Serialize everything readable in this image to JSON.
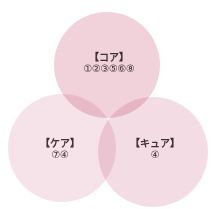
{
  "diagram": {
    "type": "venn",
    "sets": [
      {
        "id": "core",
        "title": "【コア】",
        "items": "①②③⑤⑥⑧",
        "position": "top",
        "color": "#e8b4c4"
      },
      {
        "id": "care",
        "title": "【ケア】",
        "items": "⑦④",
        "position": "bottom-left",
        "color": "#f0d0dc"
      },
      {
        "id": "cure",
        "title": "【キュア】",
        "items": "④",
        "position": "bottom-right",
        "color": "#ecc4d2"
      }
    ]
  }
}
